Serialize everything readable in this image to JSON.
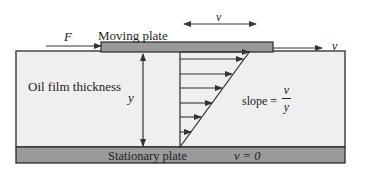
{
  "labels": {
    "force": "F",
    "moving_plate": "Moving plate",
    "velocity_top": "v",
    "velocity_right": "v",
    "oil_film": "Oil film thickness",
    "thickness": "y",
    "slope_prefix": "slope =",
    "slope_num": "v",
    "slope_den": "y",
    "stationary_plate": "Stationary plate",
    "stationary_velocity": "v = 0"
  },
  "colors": {
    "plate_fill": "#9a9a9a",
    "film_fill": "#efefef",
    "stroke": "#2a2a2a"
  }
}
